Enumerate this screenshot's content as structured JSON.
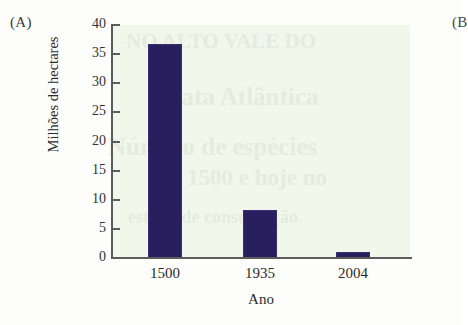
{
  "figure": {
    "panel_a_label": "(A)",
    "panel_b_label": "(B"
  },
  "colors": {
    "bar_fill": "#2a1f5e",
    "plot_background": "#f2f7ec",
    "axis": "#5c5c5c",
    "page_background": "#fdfdfb"
  },
  "ghost_text": {
    "line1": "NO ALTO VALE DO",
    "line2": "Mata Atlântica",
    "line3": "Número de espécies",
    "line4": "em 1500 e hoje no",
    "line5": "estado de conservação"
  },
  "chart_data": {
    "type": "bar",
    "title": "",
    "categories": [
      "1500",
      "1935",
      "2004"
    ],
    "values": [
      36.7,
      8.2,
      1.1
    ],
    "xlabel": "Ano",
    "ylabel": "Milhões de hectares",
    "ylim": [
      0,
      40
    ],
    "ytick_values": [
      0,
      5,
      10,
      15,
      20,
      25,
      30,
      35,
      40
    ],
    "ytick_labels": [
      "0",
      "5",
      "10",
      "15",
      "20",
      "25",
      "30",
      "35",
      "40"
    ],
    "grid": false,
    "legend": false,
    "series": [
      {
        "name": "Área de Mata Atlântica",
        "values": [
          36.7,
          8.2,
          1.1
        ]
      }
    ]
  }
}
